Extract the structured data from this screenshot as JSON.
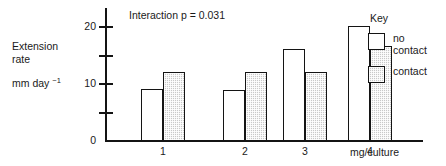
{
  "chart_data": {
    "type": "bar",
    "title": "",
    "subtitle": "",
    "annotation": "Interaction p = 0.031",
    "categories": [
      "1",
      "2",
      "3",
      "4"
    ],
    "series": [
      {
        "name": "no contact",
        "values": [
          9,
          8.8,
          16,
          20
        ]
      },
      {
        "name": "contact",
        "values": [
          12,
          12,
          12,
          16.5
        ]
      }
    ],
    "xlabel": "mg/culture",
    "ylabel_lines": [
      "Extension",
      "rate"
    ],
    "ylabel_units_prefix": "mm day ",
    "ylabel_units_exponent": "−1",
    "ylim": [
      0,
      20
    ],
    "yticks": [
      0,
      5,
      10,
      15,
      20
    ],
    "ytick_labels": [
      "0",
      "",
      "10",
      "",
      "20"
    ],
    "grid": false,
    "legend_position": "right",
    "legend_title": "Key",
    "colors": {
      "no_contact_fill": "#ffffff",
      "contact_fill": "#c9c9c9",
      "outline": "#141414",
      "text": "#1a1a1a"
    }
  },
  "axis": {
    "y_label_line1": "Extension",
    "y_label_line2": "rate",
    "y_units_text": "mm day ",
    "y_units_sup": "−1",
    "y_tick_20": "20",
    "y_tick_10": "10",
    "y_tick_0": "0",
    "x_tick_1": "1",
    "x_tick_2": "2",
    "x_tick_3": "3",
    "x_tick_4": "4",
    "x_title": "mg/culture"
  },
  "annotation": {
    "interaction_p": "Interaction p = 0.031"
  },
  "legend": {
    "title": "Key",
    "items": [
      {
        "label": "no\ncontact",
        "style": "open"
      },
      {
        "label": "contact",
        "style": "shaded"
      }
    ]
  }
}
